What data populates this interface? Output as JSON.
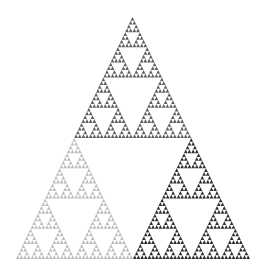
{
  "figure": {
    "depth": 6,
    "background": "#ffffff",
    "subtriangles": [
      {
        "name": "top",
        "color": "#5f5f5f"
      },
      {
        "name": "bottom-left",
        "color": "#bdbdbd"
      },
      {
        "name": "bottom-right",
        "color": "#2e2e2e"
      }
    ]
  }
}
